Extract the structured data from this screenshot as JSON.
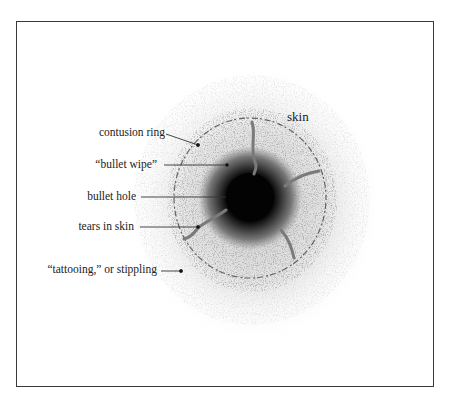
{
  "diagram": {
    "center_label": "skin",
    "labels": [
      {
        "id": "contusion-ring",
        "text": "contusion ring"
      },
      {
        "id": "bullet-wipe",
        "text": "“bullet wipe”"
      },
      {
        "id": "bullet-hole",
        "text": "bullet hole"
      },
      {
        "id": "tears-in-skin",
        "text": "tears in skin"
      },
      {
        "id": "tattooing",
        "text": "“tattooing,” or stippling"
      }
    ],
    "colors": {
      "frame": "#3a3a3a",
      "text": "#222222",
      "hole": "#050505",
      "wipe": "#6e6e6e",
      "stipple": "#8a8a8a"
    }
  }
}
